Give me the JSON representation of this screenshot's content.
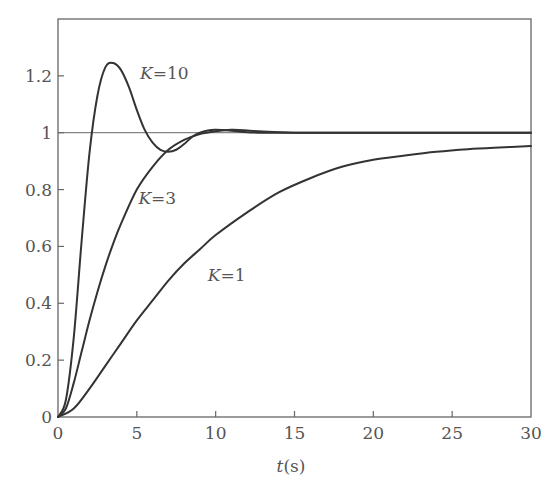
{
  "chart_data": {
    "type": "line",
    "title": "",
    "xlabel": "t(s)",
    "xlabel_var": "t",
    "xlabel_unit": "(s)",
    "ylabel": "",
    "xlim": [
      0,
      30
    ],
    "ylim": [
      0,
      1.4
    ],
    "x_ticks": [
      0,
      5,
      10,
      15,
      20,
      25,
      30
    ],
    "x_tick_labels": [
      "0",
      "5",
      "10",
      "15",
      "20",
      "25",
      "30"
    ],
    "y_ticks": [
      0,
      0.2,
      0.4,
      0.6,
      0.8,
      1,
      1.2
    ],
    "y_tick_labels": [
      "0",
      "0.2",
      "0.4",
      "0.6",
      "0.8",
      "1",
      "1.2"
    ],
    "grid": false,
    "reference_line": {
      "y": 1,
      "label": ""
    },
    "legend": "inline curve labels",
    "series": [
      {
        "name": "K=10",
        "label_var": "K",
        "label_value": "=10",
        "x": [
          0,
          0.5,
          1,
          1.5,
          2,
          2.5,
          3,
          3.5,
          4,
          4.5,
          5,
          5.5,
          6,
          6.5,
          7,
          7.5,
          8,
          8.5,
          9,
          9.5,
          10,
          11,
          12,
          13,
          14,
          15,
          20,
          25,
          30
        ],
        "values": [
          0,
          0.06,
          0.28,
          0.62,
          0.93,
          1.13,
          1.23,
          1.245,
          1.22,
          1.16,
          1.08,
          1.01,
          0.965,
          0.94,
          0.933,
          0.94,
          0.96,
          0.985,
          1.0,
          1.008,
          1.01,
          1.007,
          1.002,
          1.0,
          1.0,
          1.0,
          1.0,
          1.0,
          1.0
        ]
      },
      {
        "name": "K=3",
        "label_var": "K",
        "label_value": "=3",
        "x": [
          0,
          0.5,
          1,
          1.5,
          2,
          2.5,
          3,
          3.5,
          4,
          5,
          6,
          7,
          8,
          9,
          10,
          11,
          12,
          13,
          15,
          20,
          25,
          30
        ],
        "values": [
          0,
          0.03,
          0.12,
          0.23,
          0.34,
          0.44,
          0.53,
          0.61,
          0.68,
          0.8,
          0.88,
          0.94,
          0.975,
          0.995,
          1.005,
          1.01,
          1.008,
          1.004,
          1.0,
          1.0,
          1.0,
          1.0
        ]
      },
      {
        "name": "K=1",
        "label_var": "K",
        "label_value": "=1",
        "x": [
          0,
          1,
          2,
          3,
          4,
          5,
          6,
          7,
          8,
          9,
          10,
          12,
          14,
          16,
          18,
          20,
          22,
          24,
          26,
          28,
          30
        ],
        "values": [
          0,
          0.03,
          0.1,
          0.18,
          0.26,
          0.34,
          0.41,
          0.48,
          0.54,
          0.59,
          0.64,
          0.72,
          0.79,
          0.84,
          0.88,
          0.905,
          0.92,
          0.933,
          0.942,
          0.948,
          0.953
        ]
      }
    ],
    "annotations": [
      {
        "text": "K=10",
        "x": 5.2,
        "y": 1.21
      },
      {
        "text": "K=3",
        "x": 5.1,
        "y": 0.77
      },
      {
        "text": "K=1",
        "x": 9.5,
        "y": 0.5
      }
    ]
  },
  "style": {
    "line_color": "#333333",
    "axis_color": "#666666",
    "text_color": "#555555",
    "background": "#ffffff"
  }
}
